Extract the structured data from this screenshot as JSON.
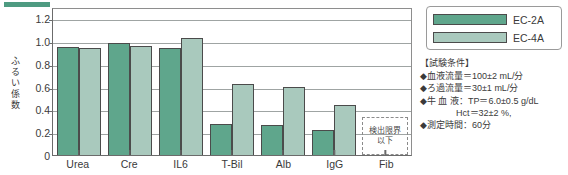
{
  "chart_data": {
    "type": "bar",
    "title": "",
    "xlabel": "",
    "ylabel": "ふるい係数",
    "ylabel_chars": [
      "ふ",
      "る",
      "い",
      "係",
      "数"
    ],
    "categories": [
      "Urea",
      "Cre",
      "IL6",
      "T-Bil",
      "Alb",
      "IgG",
      "Fib"
    ],
    "series": [
      {
        "name": "EC-2A",
        "color": "#5fa68c",
        "values": [
          0.95,
          0.98,
          0.94,
          0.27,
          0.26,
          0.22,
          null
        ]
      },
      {
        "name": "EC-4A",
        "color": "#a9c9bd",
        "values": [
          0.94,
          0.96,
          1.03,
          0.62,
          0.6,
          0.44,
          null
        ]
      }
    ],
    "ylim": [
      0,
      1.3
    ],
    "yticks": [
      0,
      0.2,
      0.4,
      0.6,
      0.8,
      1.0,
      1.2
    ],
    "ytick_labels": [
      "0",
      "0.2",
      "0.4",
      "0.6",
      "0.8",
      "1.0",
      "1.2"
    ],
    "gridlines": true,
    "legend_position": "top-right",
    "annotations": [
      {
        "category": "Fib",
        "text_lines": [
          "検出限界",
          "以下"
        ],
        "style": "dashed-box",
        "meaning": "below detection limit"
      }
    ]
  },
  "legend": {
    "items": [
      {
        "label": "EC-2A",
        "color": "#5fa68c"
      },
      {
        "label": "EC-4A",
        "color": "#a9c9bd"
      }
    ]
  },
  "conditions": {
    "title": "【試験条件】",
    "lines": [
      "◆血液流量＝100±2 mL/分",
      "◆ろ過流量＝30±1 mL/分",
      "◆牛 血 液：TP＝6.0±0.5 g/dL",
      "Hct＝32±2 %,",
      "◆測定時間：60分"
    ]
  }
}
